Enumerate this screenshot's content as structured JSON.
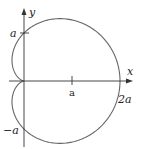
{
  "diagram": {
    "axes": {
      "x_label": "x",
      "y_label": "y"
    },
    "tick_labels": {
      "y_pos": "a",
      "y_neg": "−a",
      "x_mid": "a",
      "x_end": "2a"
    },
    "colors": {
      "curve": "#666666",
      "axis": "#333333",
      "text": "#222222"
    }
  },
  "chart_data": {
    "type": "line",
    "title": "",
    "curve": "cardioid",
    "equation": "r = a(1 + cos θ)",
    "xlabel": "x",
    "ylabel": "y",
    "x_ticks": [
      "a",
      "2a"
    ],
    "y_ticks": [
      "a",
      "−a"
    ],
    "key_points": [
      {
        "label": "cusp",
        "x": 0,
        "y": 0
      },
      {
        "label": "2a",
        "x": 2,
        "y": 0
      },
      {
        "label": "a",
        "x": 0,
        "y": 1
      },
      {
        "label": "−a",
        "x": 0,
        "y": -1
      }
    ],
    "xlim": [
      -0.5,
      2.3
    ],
    "ylim": [
      -1.4,
      1.5
    ],
    "grid": false
  }
}
